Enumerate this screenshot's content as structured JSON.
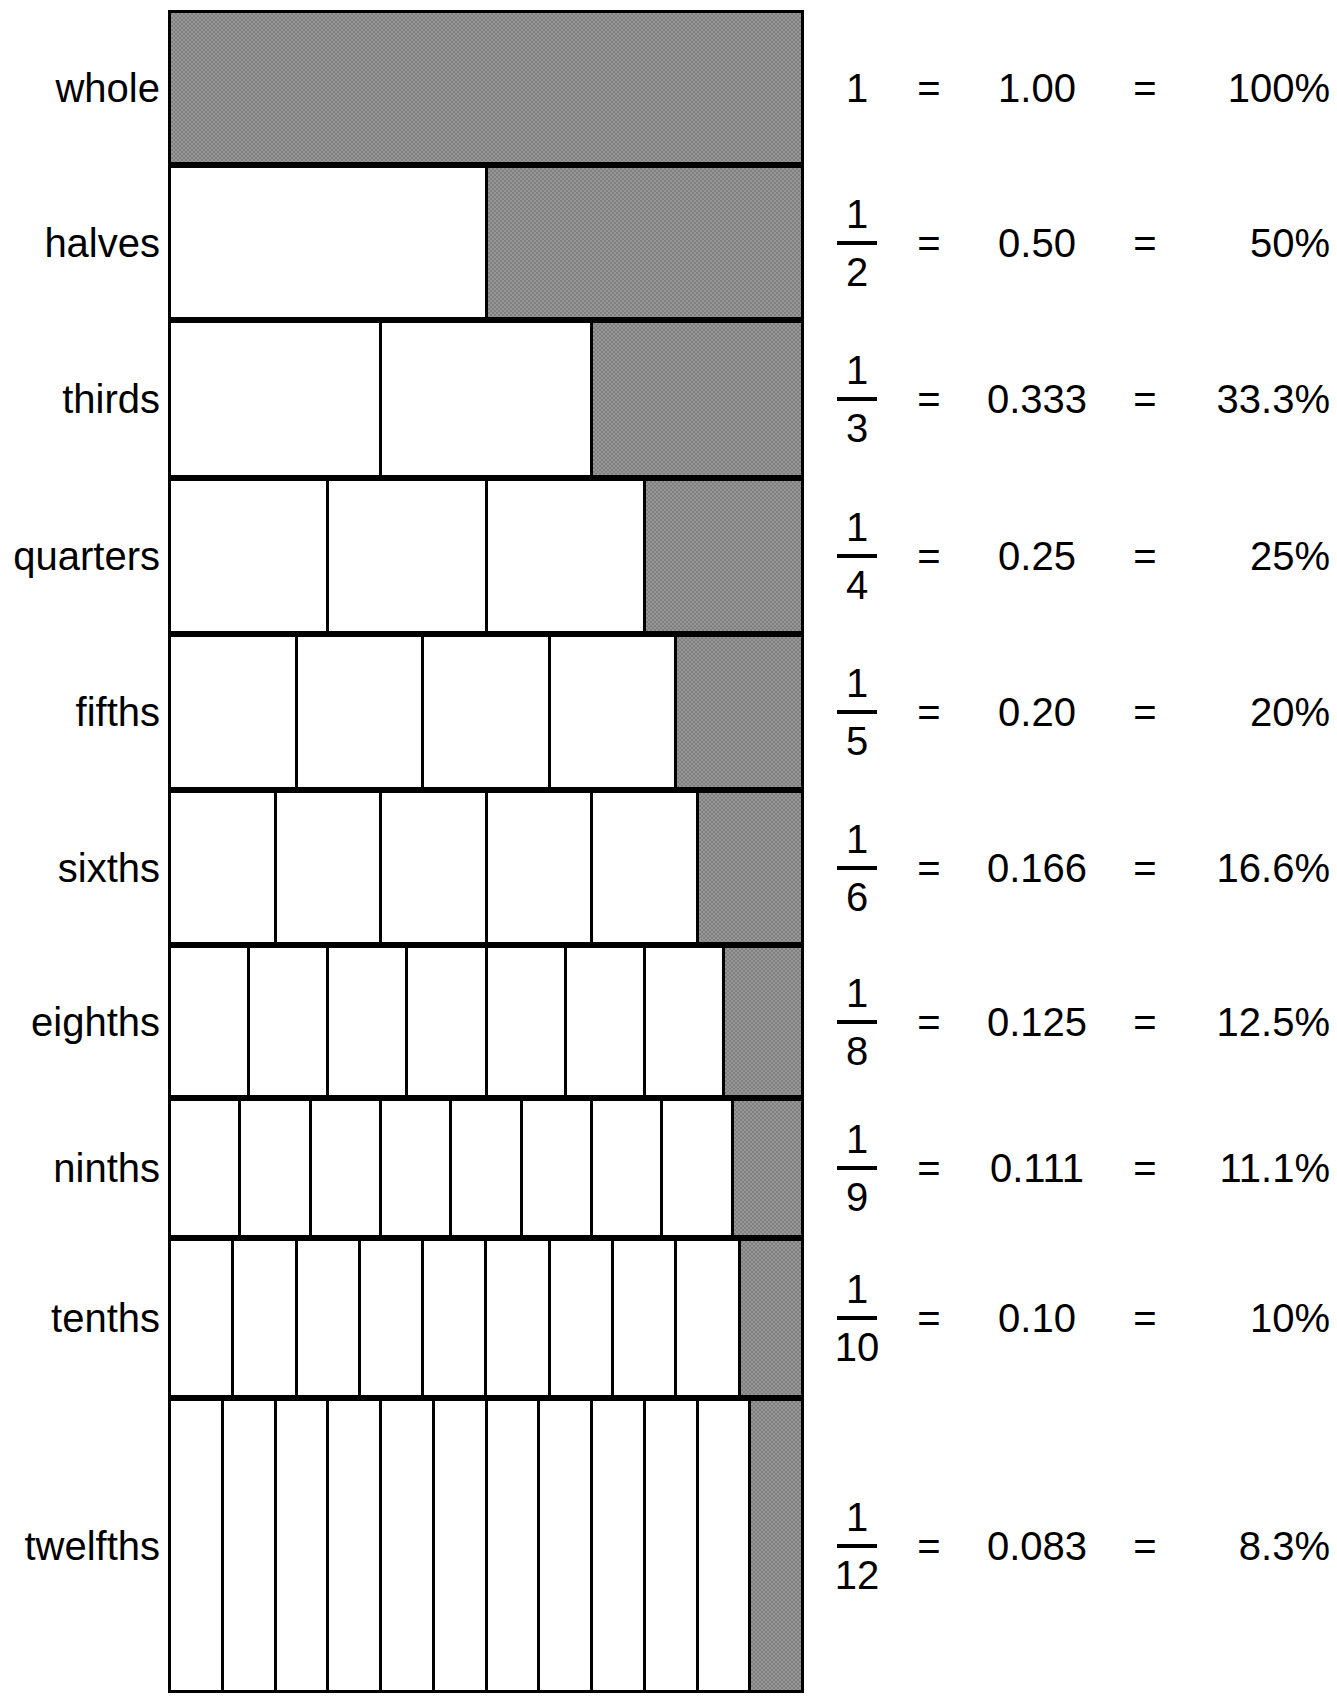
{
  "chart_data": {
    "type": "bar",
    "title": "Fraction Chart",
    "xlabel": "",
    "ylabel": "",
    "grid": false,
    "legend": "none",
    "categories": [
      "whole",
      "halves",
      "thirds",
      "quarters",
      "fifths",
      "sixths",
      "eighths",
      "ninths",
      "tenths",
      "twelfths"
    ],
    "denominators": [
      1,
      2,
      3,
      4,
      5,
      6,
      8,
      9,
      10,
      12
    ],
    "values": [
      1.0,
      0.5,
      0.333,
      0.25,
      0.2,
      0.166,
      0.125,
      0.111,
      0.1,
      0.083
    ],
    "percent_values": [
      100,
      50,
      33.3,
      25,
      20,
      16.6,
      12.5,
      11.1,
      10,
      8.3
    ]
  },
  "chart": {
    "title": "Fraction Chart",
    "equals_sign": "=",
    "rows": [
      {
        "label": "whole",
        "cells": 1,
        "shaded_index": 0,
        "numerator": "1",
        "denominator": "",
        "fraction_text": "1",
        "decimal": "1.00",
        "percent": "100%"
      },
      {
        "label": "halves",
        "cells": 2,
        "shaded_index": 1,
        "numerator": "1",
        "denominator": "2",
        "fraction_text": "1/2",
        "decimal": "0.50",
        "percent": "50%"
      },
      {
        "label": "thirds",
        "cells": 3,
        "shaded_index": 2,
        "numerator": "1",
        "denominator": "3",
        "fraction_text": "1/3",
        "decimal": "0.333",
        "percent": "33.3%"
      },
      {
        "label": "quarters",
        "cells": 4,
        "shaded_index": 3,
        "numerator": "1",
        "denominator": "4",
        "fraction_text": "1/4",
        "decimal": "0.25",
        "percent": "25%"
      },
      {
        "label": "fifths",
        "cells": 5,
        "shaded_index": 4,
        "numerator": "1",
        "denominator": "5",
        "fraction_text": "1/5",
        "decimal": "0.20",
        "percent": "20%"
      },
      {
        "label": "sixths",
        "cells": 6,
        "shaded_index": 5,
        "numerator": "1",
        "denominator": "6",
        "fraction_text": "1/6",
        "decimal": "0.166",
        "percent": "16.6%"
      },
      {
        "label": "eighths",
        "cells": 8,
        "shaded_index": 7,
        "numerator": "1",
        "denominator": "8",
        "fraction_text": "1/8",
        "decimal": "0.125",
        "percent": "12.5%"
      },
      {
        "label": "ninths",
        "cells": 9,
        "shaded_index": 8,
        "numerator": "1",
        "denominator": "9",
        "fraction_text": "1/9",
        "decimal": "0.111",
        "percent": "11.1%"
      },
      {
        "label": "tenths",
        "cells": 10,
        "shaded_index": 9,
        "numerator": "1",
        "denominator": "10",
        "fraction_text": "1/10",
        "decimal": "0.10",
        "percent": "10%"
      },
      {
        "label": "twelfths",
        "cells": 12,
        "shaded_index": 11,
        "numerator": "1",
        "denominator": "12",
        "fraction_text": "1/12",
        "decimal": "0.083",
        "percent": "8.3%"
      }
    ]
  },
  "colors": {
    "shaded_fill": "#808080",
    "unshaded_fill": "#ffffff",
    "stroke": "#000000",
    "text": "#000000"
  },
  "layout": {
    "bar_left": 168,
    "bar_width": 636,
    "row_tops": [
      10,
      165,
      320,
      478,
      634,
      790,
      945,
      1098,
      1238,
      1398
    ],
    "row_heights": [
      155,
      155,
      158,
      156,
      156,
      155,
      153,
      140,
      160,
      295
    ]
  }
}
